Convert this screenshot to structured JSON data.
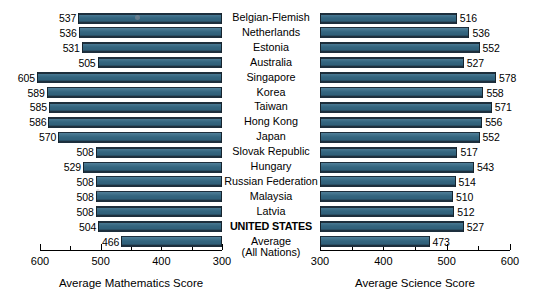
{
  "chart_data": {
    "type": "bar",
    "title": "",
    "orientation": "horizontal-back-to-back",
    "categories": [
      "Belgian-Flemish",
      "Netherlands",
      "Estonia",
      "Australia",
      "Singapore",
      "Korea",
      "Taiwan",
      "Hong Kong",
      "Japan",
      "Slovak Republic",
      "Hungary",
      "Russian Federation",
      "Malaysia",
      "Latvia",
      "UNITED STATES",
      "Average"
    ],
    "category_sublabels": {
      "Average": "(All Nations)"
    },
    "highlighted_categories": [
      "UNITED STATES"
    ],
    "series": [
      {
        "name": "Average Mathematics Score",
        "panel": "left",
        "values": [
          537,
          536,
          531,
          505,
          605,
          589,
          585,
          586,
          570,
          508,
          529,
          508,
          508,
          508,
          504,
          466
        ],
        "xlabel": "Average Mathematics Score",
        "xlim": [
          600,
          300
        ],
        "reversed": true,
        "ticks_major": [
          600,
          500,
          400,
          300
        ],
        "ticks_minor": [
          550,
          450,
          350
        ]
      },
      {
        "name": "Average Science Score",
        "panel": "right",
        "values": [
          516,
          536,
          552,
          527,
          578,
          558,
          571,
          556,
          552,
          517,
          543,
          514,
          510,
          512,
          527,
          473
        ],
        "xlabel": "Average Science Score",
        "xlim": [
          300,
          600
        ],
        "reversed": false,
        "ticks_major": [
          300,
          400,
          500,
          600
        ],
        "ticks_minor": [
          350,
          450,
          550
        ]
      }
    ],
    "grid": false,
    "legend": "none",
    "colors": {
      "bar_fill": "#33657f",
      "bar_edge": "#1d2f3d",
      "axis": "#000000",
      "background": "#ffffff"
    }
  },
  "axes": {
    "left": {
      "title": "Average Mathematics Score",
      "tick_labels": [
        "600",
        "500",
        "400",
        "300"
      ]
    },
    "right": {
      "title": "Average Science Score",
      "tick_labels": [
        "300",
        "400",
        "500",
        "600"
      ]
    }
  }
}
